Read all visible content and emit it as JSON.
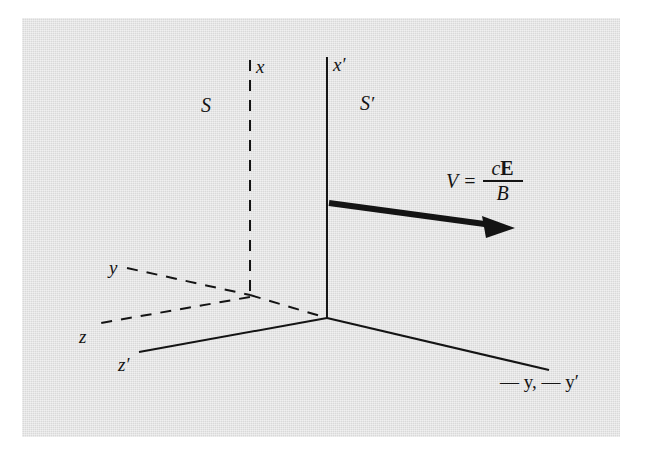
{
  "figure": {
    "background_color": "#d9d9d9",
    "line_color": "#141414"
  },
  "labels": {
    "x": "x",
    "x_prime_base": "x",
    "x_prime_mark": "′",
    "S": "S",
    "S_prime_base": "S",
    "S_prime_mark": "′",
    "y": "y",
    "z": "z",
    "z_prime_base": "z",
    "z_prime_mark": "′",
    "neg_y_axes": "— y, — y′"
  },
  "equation": {
    "lhs": "V",
    "equals": "=",
    "numerator_c": "c",
    "numerator_E": "E",
    "denominator": "B",
    "full_text": "V = cE/B"
  },
  "axes": {
    "frame_S": {
      "style": "dashed",
      "origin": "x-axis dashed vertical, y and z dashed",
      "items": [
        {
          "name": "x-axis",
          "label": "x",
          "style": "dashed"
        },
        {
          "name": "y-axis",
          "label": "y",
          "style": "dashed"
        },
        {
          "name": "z-axis",
          "label": "z",
          "style": "dashed"
        }
      ]
    },
    "frame_S_prime": {
      "style": "solid",
      "items": [
        {
          "name": "x-prime-axis",
          "label": "x′",
          "style": "solid"
        },
        {
          "name": "minus-y-axes",
          "label": "— y, — y′",
          "style": "solid"
        },
        {
          "name": "z-prime-axis",
          "label": "z′",
          "style": "solid"
        }
      ]
    }
  },
  "velocity_arrow": {
    "name": "velocity-vector",
    "description": "bold arrow pointing right and slightly down from x-prime axis"
  }
}
